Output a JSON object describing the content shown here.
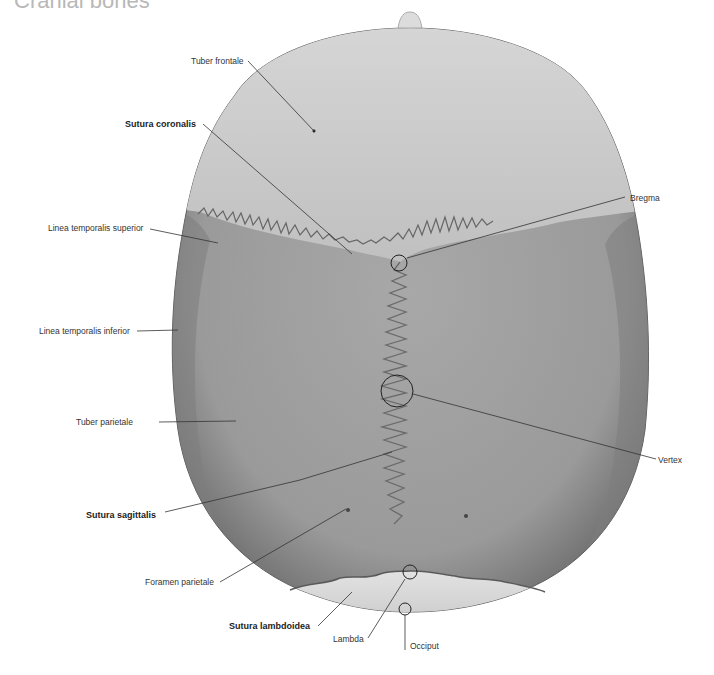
{
  "title": "Cranial bones",
  "figure": {
    "colors": {
      "frontal_bone": "#c9c9c9",
      "parietal_bone": "#9e9e9e",
      "parietal_edge": "#7a7a7a",
      "occipital_bone": "#d2d2d2",
      "suture_line": "#6a6a6a",
      "leader_line": "#333333",
      "label_text": "#333333"
    }
  },
  "labels": {
    "tuber_frontale": "Tuber frontale",
    "sutura_coronalis": "Sutura coronalis",
    "linea_temporalis_superior": "Linea temporalis superior",
    "linea_temporalis_inferior": "Linea temporalis inferior",
    "tuber_parietale": "Tuber parietale",
    "sutura_sagittalis": "Sutura sagittalis",
    "foramen_parietale": "Foramen parietale",
    "sutura_lambdoidea": "Sutura lambdoidea",
    "lambda": "Lambda",
    "occiput": "Occiput",
    "bregma": "Bregma",
    "vertex": "Vertex"
  }
}
